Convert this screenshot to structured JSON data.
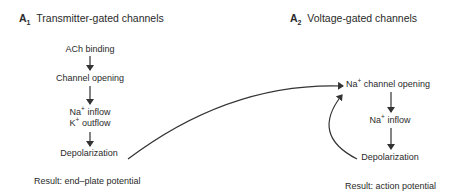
{
  "panel_a1": {
    "letter": "A",
    "subscript": "1",
    "title": "Transmitter-gated channels",
    "steps": [
      "ACh binding",
      "Channel opening",
      "Na",
      "inflow",
      "K",
      "outflow",
      "Depolarization"
    ],
    "ion_superscript": "+",
    "result": "Result: end–plate potential"
  },
  "panel_a2": {
    "letter": "A",
    "subscript": "2",
    "title": "Voltage-gated channels",
    "steps": [
      "Na",
      "channel opening",
      "Na",
      "inflow",
      "Depolarization"
    ],
    "ion_superscript": "+",
    "result": "Result: action potential"
  },
  "colors": {
    "text": "#2a2a2a",
    "arrow": "#333333",
    "background": "#ffffff"
  }
}
